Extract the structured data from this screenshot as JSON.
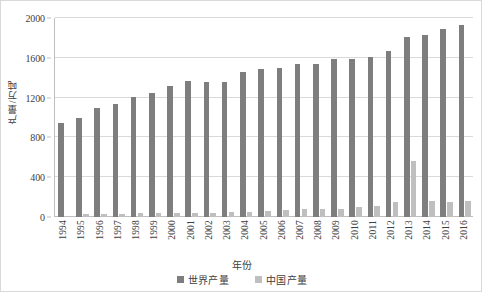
{
  "chart_data": {
    "type": "bar",
    "title": "",
    "xlabel": "年份",
    "ylabel": "产量/万吨",
    "ylim": [
      0,
      2000
    ],
    "yticks": [
      0,
      400,
      800,
      1200,
      1600,
      2000
    ],
    "grid": true,
    "legend_position": "bottom",
    "categories": [
      "1994",
      "1995",
      "1996",
      "1997",
      "1998",
      "1999",
      "2000",
      "2001",
      "2002",
      "2003",
      "2004",
      "2005",
      "2006",
      "2007",
      "2008",
      "2009",
      "2010",
      "2011",
      "2012",
      "2013",
      "2014",
      "2015",
      "2016"
    ],
    "series": [
      {
        "name": "世界产量",
        "color": "#7e7e7e",
        "values": [
          945,
          1000,
          1100,
          1140,
          1210,
          1250,
          1315,
          1365,
          1355,
          1355,
          1455,
          1490,
          1500,
          1535,
          1535,
          1585,
          1585,
          1605,
          1670,
          1810,
          1830,
          1885,
          1925
        ]
      },
      {
        "name": "中国产量",
        "color": "#bfbfbf",
        "values": [
          5,
          35,
          32,
          30,
          38,
          42,
          45,
          45,
          45,
          48,
          48,
          58,
          75,
          78,
          80,
          82,
          100,
          115,
          152,
          560,
          160,
          155,
          160
        ]
      }
    ]
  },
  "legend": {
    "entries": [
      {
        "label": "世界产量"
      },
      {
        "label": "中国产量"
      }
    ]
  },
  "axes": {
    "x_title": "年份",
    "y_title": "产量/万吨"
  }
}
